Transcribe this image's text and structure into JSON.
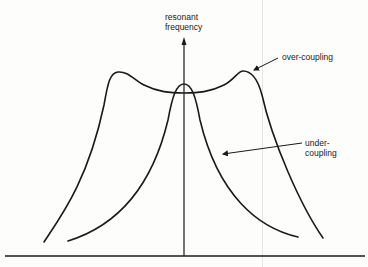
{
  "diagram": {
    "y_axis_label_line1": "resonant",
    "y_axis_label_line2": "frequency",
    "curves": [
      {
        "name": "over-coupling",
        "label": "over-coupling",
        "shape": "double-peaked"
      },
      {
        "name": "under-coupling",
        "label_line1": "under-",
        "label_line2": "coupling",
        "shape": "single-peaked"
      }
    ],
    "colors": {
      "stroke": "#1a1a1a",
      "background": "#fdfdfc"
    }
  }
}
